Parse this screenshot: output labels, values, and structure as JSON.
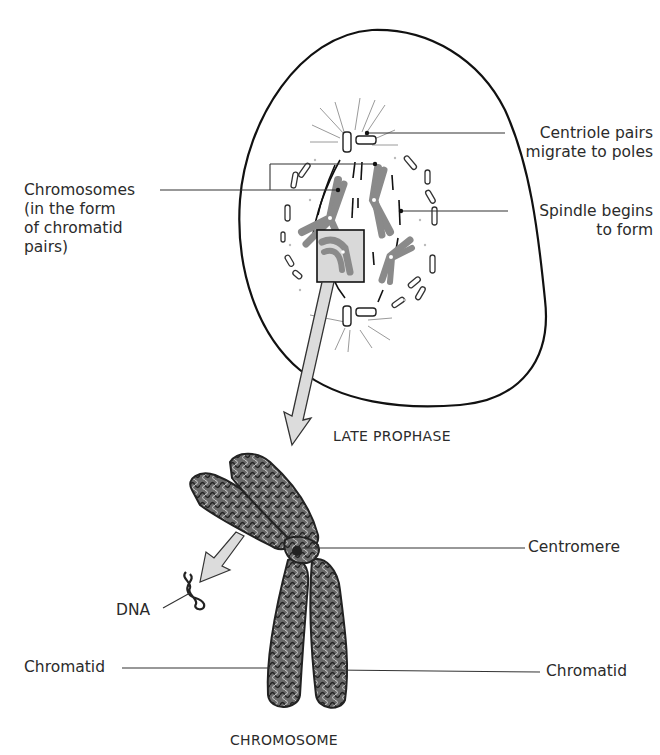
{
  "diagram": {
    "top_panel": {
      "caption": "LATE PROPHASE",
      "labels": {
        "chromosomes": [
          "Chromosomes",
          "(in the form",
          "of chromatid",
          "pairs)"
        ],
        "centriole": [
          "Centriole pairs",
          "migrate to poles"
        ],
        "spindle": [
          "Spindle begins",
          "to form"
        ]
      }
    },
    "bottom_panel": {
      "caption": "CHROMOSOME",
      "labels": {
        "centromere": "Centromere",
        "dna": "DNA",
        "chromatid_left": "Chromatid",
        "chromatid_right": "Chromatid"
      }
    },
    "colors": {
      "outline": "#111111",
      "chromosome_gray": "#8a8a8a",
      "box_fill": "#d9d9d9",
      "arrow_fill": "#dcdcdc",
      "chromatin": "#5a5a5a",
      "leader_line": "#333333"
    }
  }
}
